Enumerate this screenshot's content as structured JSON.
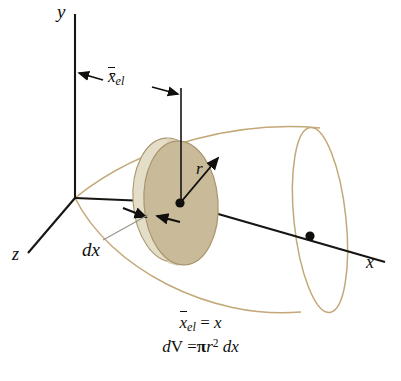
{
  "figure": {
    "background_color": "#ffffff",
    "axis_color": "#171512",
    "surface_outline_color": "#c3a878",
    "disk_fill_color": "#c9bb99",
    "disk_edge_color": "#a8956d",
    "axes": {
      "y_label": "y",
      "z_label": "z",
      "x_label": "x"
    },
    "annotations": {
      "xel_dimension_label": "x̄",
      "xel_subscript": "el",
      "radius_label": "r",
      "thickness_label": "dx"
    },
    "equations": {
      "line1": {
        "lhs_bar": "x",
        "lhs_sub": "el",
        "rel": "=",
        "rhs": "x"
      },
      "line2": {
        "lhs_d": "d",
        "lhs_V": "V",
        "rel": "=",
        "pi": "π",
        "r": "r",
        "exp": "2",
        "dx_d": "d",
        "dx_x": "x"
      }
    },
    "geometry": {
      "origin": [
        75,
        198
      ],
      "y_axis_top": [
        75,
        14
      ],
      "z_axis_end": [
        26,
        256
      ],
      "x_axis_end": [
        385,
        262
      ],
      "disk_center": [
        180,
        203
      ],
      "disk_radius_x": 38,
      "disk_radius_y": 62,
      "centroid_point": [
        310,
        236
      ],
      "dimension_line_y": 82
    }
  }
}
